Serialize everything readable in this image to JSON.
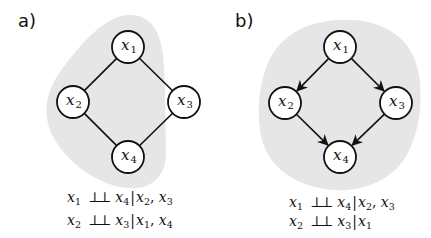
{
  "colors": {
    "blob": "#e6e6e6",
    "edge": "#111111",
    "node_fill": "#ffffff",
    "node_stroke": "#111111",
    "text": "#111111"
  },
  "panels": [
    {
      "label": "a)",
      "graph_type": "undirected",
      "nodes": [
        {
          "id": "x1",
          "var": "x",
          "sub": "1",
          "cx": 128,
          "cy": 47
        },
        {
          "id": "x2",
          "var": "x",
          "sub": "2",
          "cx": 73,
          "cy": 102
        },
        {
          "id": "x3",
          "var": "x",
          "sub": "3",
          "cx": 184,
          "cy": 102
        },
        {
          "id": "x4",
          "var": "x",
          "sub": "4",
          "cx": 128,
          "cy": 157
        }
      ],
      "edges": [
        {
          "from": "x1",
          "to": "x2",
          "directed": false
        },
        {
          "from": "x1",
          "to": "x3",
          "directed": false
        },
        {
          "from": "x2",
          "to": "x4",
          "directed": false
        },
        {
          "from": "x3",
          "to": "x4",
          "directed": false
        }
      ],
      "statements": [
        {
          "lhs": {
            "var": "x",
            "sub": "1"
          },
          "symbol": "⊥⊥",
          "rhs": {
            "var": "x",
            "sub": "4"
          },
          "given": [
            {
              "var": "x",
              "sub": "2"
            },
            {
              "var": "x",
              "sub": "3"
            }
          ]
        },
        {
          "lhs": {
            "var": "x",
            "sub": "2"
          },
          "symbol": "⊥⊥",
          "rhs": {
            "var": "x",
            "sub": "3"
          },
          "given": [
            {
              "var": "x",
              "sub": "1"
            },
            {
              "var": "x",
              "sub": "4"
            }
          ]
        }
      ]
    },
    {
      "label": "b)",
      "graph_type": "directed",
      "nodes": [
        {
          "id": "x1",
          "var": "x",
          "sub": "1",
          "cx": 340,
          "cy": 47
        },
        {
          "id": "x2",
          "var": "x",
          "sub": "2",
          "cx": 285,
          "cy": 103
        },
        {
          "id": "x3",
          "var": "x",
          "sub": "3",
          "cx": 396,
          "cy": 103
        },
        {
          "id": "x4",
          "var": "x",
          "sub": "4",
          "cx": 340,
          "cy": 157
        }
      ],
      "edges": [
        {
          "from": "x1",
          "to": "x2",
          "directed": true
        },
        {
          "from": "x1",
          "to": "x3",
          "directed": true
        },
        {
          "from": "x2",
          "to": "x4",
          "directed": true
        },
        {
          "from": "x3",
          "to": "x4",
          "directed": true
        }
      ],
      "statements": [
        {
          "lhs": {
            "var": "x",
            "sub": "1"
          },
          "symbol": "⊥⊥",
          "rhs": {
            "var": "x",
            "sub": "4"
          },
          "given": [
            {
              "var": "x",
              "sub": "2"
            },
            {
              "var": "x",
              "sub": "3"
            }
          ]
        },
        {
          "lhs": {
            "var": "x",
            "sub": "2"
          },
          "symbol": "⊥⊥",
          "rhs": {
            "var": "x",
            "sub": "3"
          },
          "given": [
            {
              "var": "x",
              "sub": "1"
            }
          ]
        }
      ]
    }
  ]
}
